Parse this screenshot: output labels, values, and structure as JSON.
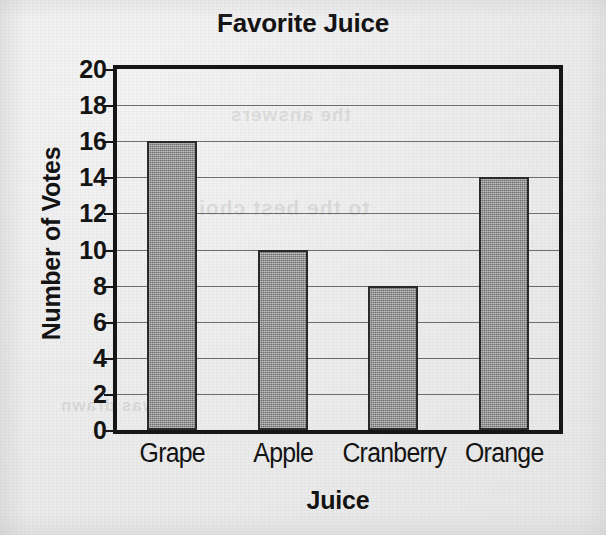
{
  "chart_data": {
    "type": "bar",
    "title": "Favorite Juice",
    "xlabel": "Juice",
    "ylabel": "Number of Votes",
    "categories": [
      "Grape",
      "Apple",
      "Cranberry",
      "Orange"
    ],
    "values": [
      16,
      10,
      8,
      14
    ],
    "ylim": [
      0,
      20
    ],
    "ytick_step": 2,
    "yticks": [
      20,
      18,
      16,
      14,
      12,
      10,
      8,
      6,
      4,
      2,
      0
    ],
    "grid": true,
    "legend": "none",
    "bar_fill_color": "#8d8d8d",
    "bar_edge_color": "#2a2a2a",
    "axis_color": "#161616",
    "gridline_color": "#6d6d6d",
    "background_color": "#eeeeee",
    "text_color": "#131313"
  },
  "bleed_through": [
    "the answers",
    "to the best choices",
    "was drawn"
  ]
}
